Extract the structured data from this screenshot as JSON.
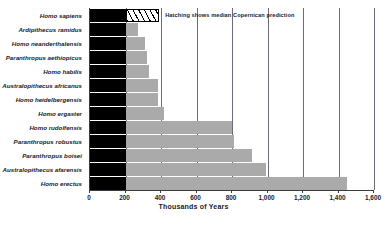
{
  "chart_data": {
    "type": "bar",
    "orientation": "horizontal",
    "title": "",
    "xlabel": "Thousands of Years",
    "ylabel": "",
    "xlim": [
      0,
      1600
    ],
    "xticks": [
      0,
      200,
      400,
      600,
      800,
      1000,
      1200,
      1400,
      1600
    ],
    "xtick_labels": [
      "0",
      "200",
      "400",
      "600",
      "800",
      "1,000",
      "1,200",
      "1,400",
      "1,600"
    ],
    "grid": true,
    "legend_position": "inside-top-right",
    "annotation": "Hatching shows median Copernican prediction",
    "series_note": "Each bar has a solid black observed segment from 0 to 200 and a lighter extension to the total value; the top bar's extension is hatched.",
    "categories": [
      "Homo sapiens",
      "Ardipithecus ramidus",
      "Homo neanderthalensis",
      "Paranthropus aethiopicus",
      "Homo habilis",
      "Australopithecus africanus",
      "Homo heidelbergensis",
      "Homo ergaster",
      "Homo rudolfensis",
      "Paranthropus robustus",
      "Paranthropus boisei",
      "Australopithecus afarensis",
      "Homo erectus"
    ],
    "values": [
      390,
      270,
      310,
      320,
      330,
      385,
      385,
      415,
      800,
      810,
      915,
      990,
      1450
    ],
    "black_segment": 200,
    "styles": [
      "hatched",
      "solid",
      "solid",
      "solid",
      "solid",
      "solid",
      "solid",
      "solid",
      "solid",
      "solid",
      "solid",
      "solid",
      "solid"
    ],
    "colors": {
      "black_segment": "#000000",
      "extension": "#aaaaaa",
      "hatch_line": "#000000",
      "axis": "#3a3a4a",
      "grid": "#6b6b7a",
      "text": "#1a1a28",
      "background": "#ffffff"
    }
  }
}
